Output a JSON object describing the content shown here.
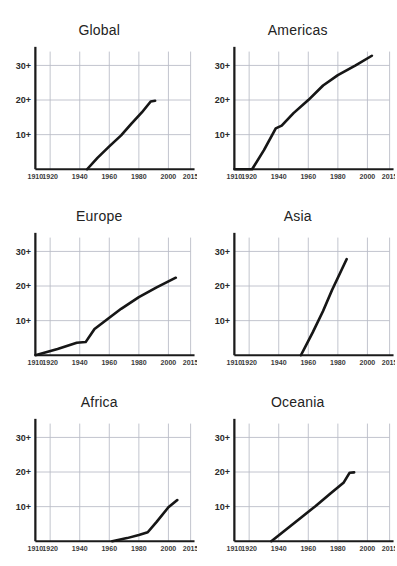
{
  "page": {
    "clipped_title": "",
    "background": "#ffffff"
  },
  "axis": {
    "y_ticks": [
      "10+",
      "20+",
      "30+"
    ],
    "y_values": [
      10,
      20,
      30
    ],
    "x_ticks": [
      "1910",
      "1920",
      "1940",
      "1960",
      "1980",
      "2000",
      "2015"
    ],
    "x_values": [
      1910,
      1920,
      1940,
      1960,
      1980,
      2000,
      2015
    ],
    "xlim": [
      1910,
      2015
    ],
    "ylim": [
      0,
      34
    ],
    "grid": true,
    "line_color": "#161616",
    "grid_color": "#b9bcc6",
    "axis_color": "#1b1b1b"
  },
  "panels": [
    {
      "key": "global",
      "title": "Global"
    },
    {
      "key": "americas",
      "title": "Americas"
    },
    {
      "key": "europe",
      "title": "Europe"
    },
    {
      "key": "asia",
      "title": "Asia"
    },
    {
      "key": "africa",
      "title": "Africa"
    },
    {
      "key": "oceania",
      "title": "Oceania"
    }
  ],
  "chart_data": {
    "type": "line",
    "title": "",
    "xlabel": "",
    "ylabel": "",
    "xlim": [
      1910,
      2015
    ],
    "ylim": [
      0,
      34
    ],
    "grid": true,
    "legend": "none",
    "xticks": [
      1910,
      1920,
      1940,
      1960,
      1980,
      2000,
      2015
    ],
    "yticks": [
      10,
      20,
      30
    ],
    "ytick_labels": [
      "10+",
      "20+",
      "30+"
    ],
    "small_multiples": true,
    "panels": [
      {
        "name": "Global",
        "x": [
          1945,
          1952,
          1960,
          1968,
          1975,
          1982,
          1988,
          1991
        ],
        "y": [
          0,
          3.3,
          6.6,
          9.8,
          13.2,
          16.4,
          19.6,
          19.8
        ]
      },
      {
        "name": "Americas",
        "x": [
          1910,
          1922,
          1930,
          1938,
          1942,
          1950,
          1960,
          1970,
          1980,
          1992,
          2003
        ],
        "y": [
          0,
          0,
          5.5,
          11.8,
          12.6,
          16.2,
          20.0,
          24.2,
          27.2,
          30.0,
          32.8
        ]
      },
      {
        "name": "Europe",
        "x": [
          1910,
          1925,
          1938,
          1944,
          1950,
          1958,
          1968,
          1980,
          1992,
          2005
        ],
        "y": [
          0,
          1.8,
          3.6,
          3.8,
          7.6,
          10.2,
          13.4,
          16.8,
          19.6,
          22.4
        ]
      },
      {
        "name": "Asia",
        "x": [
          1955,
          1963,
          1970,
          1976,
          1982,
          1986
        ],
        "y": [
          0,
          6.6,
          12.8,
          18.8,
          24.2,
          27.8
        ]
      },
      {
        "name": "Africa",
        "x": [
          1962,
          1972,
          1980,
          1986,
          1992,
          2000,
          2006
        ],
        "y": [
          0,
          0.9,
          1.8,
          2.6,
          5.6,
          9.8,
          11.9
        ]
      },
      {
        "name": "Oceania",
        "x": [
          1935,
          1945,
          1955,
          1965,
          1975,
          1984,
          1988,
          1991
        ],
        "y": [
          0,
          3.4,
          6.8,
          10.2,
          13.8,
          17.0,
          19.8,
          19.9
        ]
      }
    ]
  }
}
